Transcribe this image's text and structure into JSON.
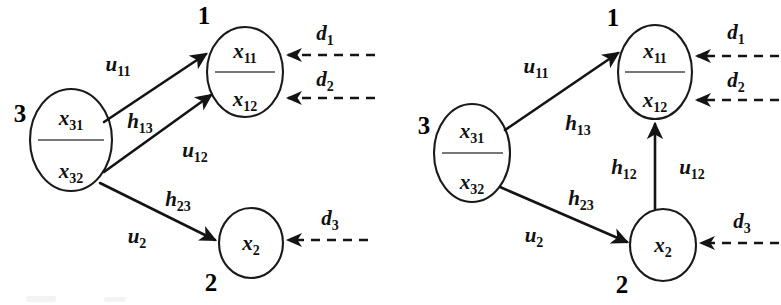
{
  "figure": {
    "background_color": "#ffffff",
    "stroke_color": "#141414",
    "panels": [
      {
        "id": "panel-left",
        "name": "left-diagram",
        "nodes": [
          {
            "id": "node1",
            "number": "1",
            "shape": "ellipse",
            "states": [
              "x",
              "x"
            ],
            "state_labels": [
              {
                "base": "x",
                "sub": "11"
              },
              {
                "base": "x",
                "sub": "12"
              }
            ],
            "split": true
          },
          {
            "id": "node2",
            "number": "2",
            "shape": "ellipse",
            "state_labels": [
              {
                "base": "x",
                "sub": "2"
              }
            ],
            "split": false
          },
          {
            "id": "node3",
            "number": "3",
            "shape": "ellipse",
            "state_labels": [
              {
                "base": "x",
                "sub": "31"
              },
              {
                "base": "x",
                "sub": "32"
              }
            ],
            "split": true
          }
        ],
        "edges": [
          {
            "id": "e-3-to-1a",
            "from": "node3",
            "to": "node1",
            "style": "solid",
            "labels": [
              {
                "base": "u",
                "sub": "11"
              }
            ]
          },
          {
            "id": "e-3-to-1b",
            "from": "node3",
            "to": "node1",
            "style": "solid",
            "labels": [
              {
                "base": "h",
                "sub": "13"
              },
              {
                "base": "u",
                "sub": "12"
              }
            ]
          },
          {
            "id": "e-3-to-2",
            "from": "node3",
            "to": "node2",
            "style": "solid",
            "labels": [
              {
                "base": "h",
                "sub": "23"
              },
              {
                "base": "u",
                "sub": "2"
              }
            ]
          }
        ],
        "disturbances": [
          {
            "id": "d1",
            "base": "d",
            "sub": "1",
            "target": "node1",
            "style": "dashed"
          },
          {
            "id": "d2",
            "base": "d",
            "sub": "2",
            "target": "node1",
            "style": "dashed"
          },
          {
            "id": "d3",
            "base": "d",
            "sub": "3",
            "target": "node2",
            "style": "dashed"
          }
        ]
      },
      {
        "id": "panel-right",
        "name": "right-diagram",
        "nodes": [
          {
            "id": "node1",
            "number": "1",
            "shape": "ellipse",
            "state_labels": [
              {
                "base": "x",
                "sub": "11"
              },
              {
                "base": "x",
                "sub": "12"
              }
            ],
            "split": true
          },
          {
            "id": "node2",
            "number": "2",
            "shape": "ellipse",
            "state_labels": [
              {
                "base": "x",
                "sub": "2"
              }
            ],
            "split": false
          },
          {
            "id": "node3",
            "number": "3",
            "shape": "ellipse",
            "state_labels": [
              {
                "base": "x",
                "sub": "31"
              },
              {
                "base": "x",
                "sub": "32"
              }
            ],
            "split": true
          }
        ],
        "edges": [
          {
            "id": "e-3-to-1",
            "from": "node3",
            "to": "node1",
            "style": "solid",
            "labels": [
              {
                "base": "u",
                "sub": "11"
              },
              {
                "base": "h",
                "sub": "13"
              }
            ]
          },
          {
            "id": "e-3-to-2",
            "from": "node3",
            "to": "node2",
            "style": "solid",
            "labels": [
              {
                "base": "h",
                "sub": "23"
              },
              {
                "base": "u",
                "sub": "2"
              }
            ]
          },
          {
            "id": "e-2-to-1",
            "from": "node2",
            "to": "node1",
            "style": "solid",
            "labels": [
              {
                "base": "h",
                "sub": "12"
              },
              {
                "base": "u",
                "sub": "12"
              }
            ]
          }
        ],
        "disturbances": [
          {
            "id": "d1",
            "base": "d",
            "sub": "1",
            "target": "node1",
            "style": "dashed"
          },
          {
            "id": "d2",
            "base": "d",
            "sub": "2",
            "target": "node1",
            "style": "dashed"
          },
          {
            "id": "d3",
            "base": "d",
            "sub": "3",
            "target": "node2",
            "style": "dashed"
          }
        ]
      }
    ]
  }
}
